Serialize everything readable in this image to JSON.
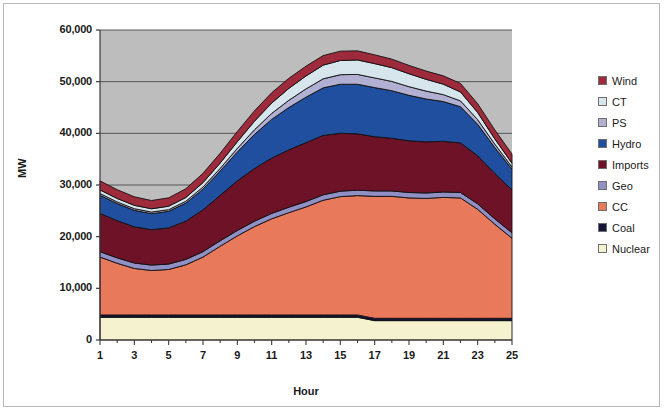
{
  "chart_data": {
    "type": "area",
    "stacked": true,
    "title": "",
    "xlabel": "Hour",
    "ylabel": "MW",
    "xlim": [
      1,
      25
    ],
    "ylim": [
      0,
      60000
    ],
    "ytick_labels": [
      "60,000",
      "50,000",
      "40,000",
      "30,000",
      "20,000",
      "10,000",
      "0"
    ],
    "ytick_values": [
      60000,
      50000,
      40000,
      30000,
      20000,
      10000,
      0
    ],
    "xtick_labels": [
      "1",
      "3",
      "5",
      "7",
      "9",
      "11",
      "13",
      "15",
      "17",
      "19",
      "21",
      "23",
      "25"
    ],
    "xtick_values": [
      1,
      3,
      5,
      7,
      9,
      11,
      13,
      15,
      17,
      19,
      21,
      23,
      25
    ],
    "grid": "horizontal",
    "legend_position": "right",
    "plot_background": "#bdbdbd",
    "x": [
      1,
      2,
      3,
      4,
      5,
      6,
      7,
      8,
      9,
      10,
      11,
      12,
      13,
      14,
      15,
      16,
      17,
      18,
      19,
      20,
      21,
      22,
      23,
      24,
      25
    ],
    "series": [
      {
        "name": "Nuclear",
        "color": "#f5f2cf",
        "values": [
          4400,
          4400,
          4400,
          4400,
          4400,
          4400,
          4400,
          4400,
          4400,
          4400,
          4400,
          4400,
          4400,
          4400,
          4400,
          4400,
          3750,
          3750,
          3750,
          3750,
          3750,
          3750,
          3750,
          3750,
          3750
        ]
      },
      {
        "name": "Coal",
        "color": "#15153c",
        "values": [
          450,
          450,
          450,
          450,
          450,
          450,
          450,
          450,
          450,
          450,
          450,
          450,
          450,
          450,
          450,
          450,
          450,
          450,
          450,
          450,
          450,
          450,
          450,
          450,
          450
        ]
      },
      {
        "name": "CC",
        "color": "#e8795a",
        "values": [
          11200,
          10000,
          9000,
          8600,
          8800,
          9700,
          11200,
          13300,
          15300,
          17100,
          18600,
          19800,
          20900,
          22200,
          22900,
          23100,
          23600,
          23600,
          23300,
          23200,
          23400,
          23300,
          21100,
          18200,
          15500
        ]
      },
      {
        "name": "Geo",
        "color": "#9090c4",
        "values": [
          1050,
          1050,
          1050,
          1050,
          1050,
          1050,
          1050,
          1050,
          1050,
          1050,
          1050,
          1050,
          1050,
          1050,
          1050,
          1050,
          1050,
          1050,
          1050,
          1050,
          1050,
          1050,
          1050,
          1050,
          1050
        ]
      },
      {
        "name": "Imports",
        "color": "#6e1228",
        "values": [
          7400,
          7200,
          7000,
          6850,
          7000,
          7400,
          8100,
          8800,
          9600,
          10200,
          10700,
          11100,
          11400,
          11500,
          11200,
          10900,
          10500,
          10200,
          10000,
          9900,
          9800,
          9600,
          9300,
          8800,
          8300
        ]
      },
      {
        "name": "Hydro",
        "color": "#1f4f9e",
        "values": [
          3500,
          3300,
          3200,
          3100,
          3200,
          3500,
          4000,
          4700,
          5600,
          6600,
          7500,
          8200,
          8800,
          9200,
          9500,
          9600,
          9500,
          9200,
          8800,
          8300,
          7700,
          7000,
          6100,
          5000,
          4000
        ]
      },
      {
        "name": "PS",
        "color": "#b2b0d2",
        "values": [
          350,
          330,
          320,
          320,
          330,
          360,
          420,
          520,
          680,
          900,
          1150,
          1400,
          1600,
          1750,
          1850,
          1900,
          1880,
          1800,
          1680,
          1520,
          1340,
          1130,
          900,
          650,
          430
        ]
      },
      {
        "name": "CT",
        "color": "#d7e5ed",
        "values": [
          700,
          660,
          640,
          630,
          660,
          720,
          840,
          1020,
          1300,
          1650,
          2000,
          2300,
          2500,
          2650,
          2750,
          2800,
          2760,
          2660,
          2500,
          2280,
          2020,
          1720,
          1380,
          1020,
          720
        ]
      },
      {
        "name": "Wind",
        "color": "#9d2b3b",
        "values": [
          1750,
          1700,
          1650,
          1600,
          1620,
          1700,
          1800,
          1900,
          1980,
          2020,
          2000,
          1950,
          1900,
          1850,
          1800,
          1760,
          1700,
          1650,
          1620,
          1600,
          1620,
          1660,
          1700,
          1740,
          1780
        ]
      }
    ],
    "legend_entries": [
      {
        "label": "Wind",
        "color": "#9d2b3b"
      },
      {
        "label": "CT",
        "color": "#d7e5ed"
      },
      {
        "label": "PS",
        "color": "#b2b0d2"
      },
      {
        "label": "Hydro",
        "color": "#1f4f9e"
      },
      {
        "label": "Imports",
        "color": "#6e1228"
      },
      {
        "label": "Geo",
        "color": "#9090c4"
      },
      {
        "label": "CC",
        "color": "#e8795a"
      },
      {
        "label": "Coal",
        "color": "#15153c"
      },
      {
        "label": "Nuclear",
        "color": "#f5f2cf"
      }
    ]
  }
}
